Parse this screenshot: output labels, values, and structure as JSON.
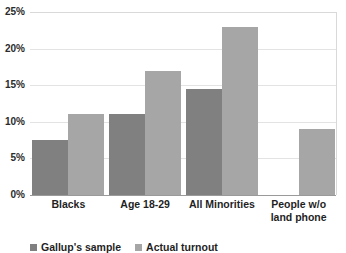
{
  "chart_data": {
    "type": "bar",
    "title": "",
    "subtitle": "",
    "xlabel": "",
    "ylabel": "",
    "ylim": [
      0,
      25
    ],
    "yticks": [
      "0%",
      "5%",
      "10%",
      "15%",
      "20%",
      "25%"
    ],
    "ytick_values": [
      0,
      5,
      10,
      15,
      20,
      25
    ],
    "grid": true,
    "legend_position": "bottom-left",
    "categories": [
      "Blacks",
      "Age 18-29",
      "All Minorities",
      "People w/o land phone"
    ],
    "category_label_lines": [
      [
        "Blacks"
      ],
      [
        "Age 18-29"
      ],
      [
        "All Minorities"
      ],
      [
        "People w/o",
        "land phone"
      ]
    ],
    "series": [
      {
        "name": "Gallup's sample",
        "color": "#808080",
        "values": [
          7.5,
          11,
          14.5,
          null
        ]
      },
      {
        "name": "Actual turnout",
        "color": "#a6a6a6",
        "values": [
          11,
          17,
          23,
          9
        ]
      }
    ]
  },
  "axis": {
    "y_ticks": [
      {
        "label": "25%",
        "value": 25
      },
      {
        "label": "20%",
        "value": 20
      },
      {
        "label": "15%",
        "value": 15
      },
      {
        "label": "10%",
        "value": 10
      },
      {
        "label": "5%",
        "value": 5
      },
      {
        "label": "0%",
        "value": 0
      }
    ]
  },
  "legend": {
    "items": [
      {
        "label": "Gallup's sample",
        "color": "#808080"
      },
      {
        "label": "Actual turnout",
        "color": "#a6a6a6"
      }
    ]
  },
  "colors": {
    "series_1": "#808080",
    "series_2": "#a6a6a6",
    "gridline": "#e3e3e3",
    "axis": "#9a9a9a",
    "text": "#1f1f1f",
    "background": "#ffffff"
  }
}
